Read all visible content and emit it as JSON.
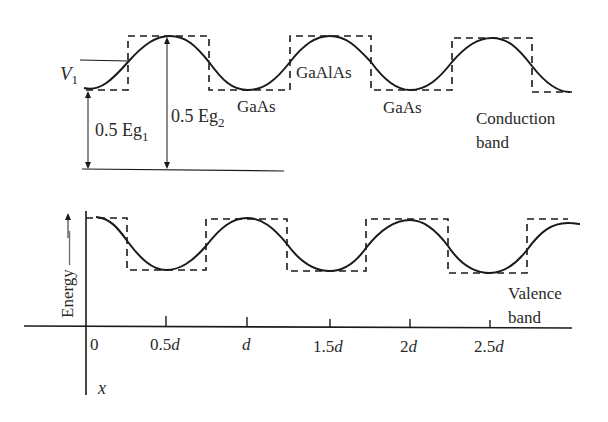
{
  "labels": {
    "v1": "V",
    "v1_sub": "1",
    "eg1_prefix": "0.5 Eg",
    "eg1_sub": "1",
    "eg2_prefix": "0.5 Eg",
    "eg2_sub": "2",
    "gaas_1": "GaAs",
    "gaalas": "GaAlAs",
    "gaas_2": "GaAs",
    "conduction_line1": "Conduction",
    "conduction_line2": "band",
    "valence_line1": "Valence",
    "valence_line2": "band",
    "energy_axis": "Energy ——",
    "x_axis": "x"
  },
  "x_ticks": [
    "0",
    "0.5d",
    "d",
    "1.5d",
    "2d",
    "2.5d"
  ],
  "colors": {
    "line": "#1a1a1a",
    "text": "#2a2a2a",
    "background": "#ffffff"
  }
}
